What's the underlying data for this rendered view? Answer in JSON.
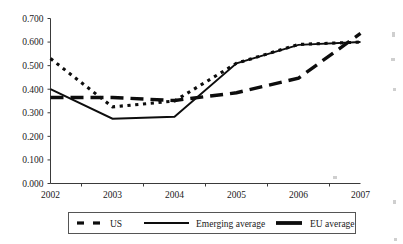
{
  "chart_data": {
    "type": "line",
    "title": "",
    "xlabel": "",
    "ylabel": "",
    "categories": [
      "2002",
      "2003",
      "2004",
      "2005",
      "2006",
      "2007"
    ],
    "x": [
      2002,
      2003,
      2004,
      2005,
      2006,
      2007
    ],
    "xlim": [
      2002,
      2007
    ],
    "ylim": [
      0.0,
      0.7
    ],
    "ytick_labels": [
      "0.700",
      "0.600",
      "0.500",
      "0.400",
      "0.300",
      "0.200",
      "0.100",
      "0.000"
    ],
    "ytick_values": [
      0.7,
      0.6,
      0.5,
      0.4,
      0.3,
      0.2,
      0.1,
      0.0
    ],
    "xtick_labels": [
      "2002",
      "2003",
      "2004",
      "2005",
      "2006",
      "2007"
    ],
    "grid": false,
    "legend_position": "bottom",
    "series": [
      {
        "name": "US",
        "style": "dotted",
        "color": "#0d0d0d",
        "values": [
          0.53,
          0.325,
          0.35,
          0.51,
          0.59,
          0.6
        ]
      },
      {
        "name": "Emerging average",
        "style": "solid",
        "color": "#0d0d0d",
        "values": [
          0.4,
          0.275,
          0.283,
          0.51,
          0.588,
          0.6
        ]
      },
      {
        "name": "EU average",
        "style": "dashed-thick",
        "color": "#0d0d0d",
        "values": [
          0.365,
          0.365,
          0.352,
          0.385,
          0.447,
          0.637
        ]
      }
    ]
  },
  "legend": {
    "items": [
      {
        "label": "US"
      },
      {
        "label": "Emerging average"
      },
      {
        "label": "EU average"
      }
    ]
  },
  "axes": {
    "y_labels": [
      "0.700",
      "0.600",
      "0.500",
      "0.400",
      "0.300",
      "0.200",
      "0.100",
      "0.000"
    ],
    "x_labels": [
      "2002",
      "2003",
      "2004",
      "2005",
      "2006",
      "2007"
    ]
  }
}
